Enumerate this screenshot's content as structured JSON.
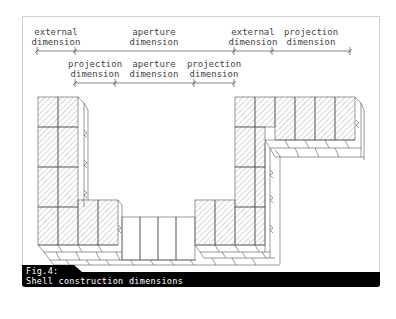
{
  "figure": {
    "number_label": "Fig.4:",
    "caption": "Shell construction dimensions",
    "caption_bg": "#000000",
    "line_color": "#555555",
    "hatch_color": "#777777"
  },
  "dimensions_row1": [
    {
      "line1": "external",
      "line2": "dimension",
      "cx": 56
    },
    {
      "line1": "aperture",
      "line2": "dimension",
      "cx": 154
    },
    {
      "line1": "external",
      "line2": "dimension",
      "cx": 253
    },
    {
      "line1": "projection",
      "line2": "dimension",
      "cx": 311
    }
  ],
  "dimensions_row2": [
    {
      "line1": "projection",
      "line2": "dimension",
      "cx": 95
    },
    {
      "line1": "aperture",
      "line2": "dimension",
      "cx": 154
    },
    {
      "line1": "projection",
      "line2": "dimension",
      "cx": 214
    }
  ],
  "row1_ticks": [
    37,
    75,
    234,
    272,
    350
  ],
  "row2_ticks": [
    75,
    115,
    194,
    234
  ]
}
